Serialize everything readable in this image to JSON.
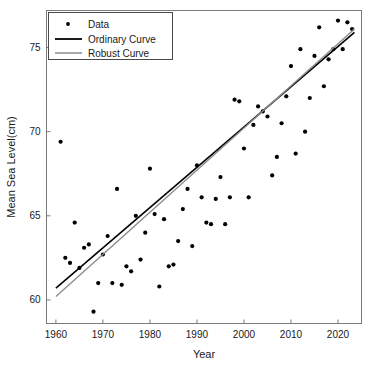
{
  "chart_data": {
    "type": "scatter",
    "title": "",
    "xlabel": "Year",
    "ylabel": "Mean Sea Level(cm)",
    "xlim": [
      1958,
      2025
    ],
    "ylim": [
      58.6,
      77.2
    ],
    "xticks": [
      1960,
      1970,
      1980,
      1990,
      2000,
      2010,
      2020
    ],
    "yticks": [
      60,
      65,
      70,
      75
    ],
    "grid": false,
    "legend_position": "upper-left",
    "legend": [
      {
        "label": "Data",
        "marker": "dot",
        "color": "#000000"
      },
      {
        "label": "Ordinary Curve",
        "marker": "line",
        "color": "#000000"
      },
      {
        "label": "Robust Curve",
        "marker": "line",
        "color": "#8c8c8c"
      }
    ],
    "series": [
      {
        "name": "Data",
        "type": "scatter",
        "color": "#000000",
        "points": [
          [
            1961,
            69.4
          ],
          [
            1962,
            62.5
          ],
          [
            1963,
            62.2
          ],
          [
            1964,
            64.6
          ],
          [
            1965,
            61.9
          ],
          [
            1966,
            63.1
          ],
          [
            1967,
            63.3
          ],
          [
            1968,
            59.3
          ],
          [
            1969,
            61.0
          ],
          [
            1970,
            62.7
          ],
          [
            1971,
            63.8
          ],
          [
            1972,
            61.0
          ],
          [
            1973,
            66.6
          ],
          [
            1974,
            60.9
          ],
          [
            1975,
            62.0
          ],
          [
            1976,
            61.7
          ],
          [
            1977,
            65.0
          ],
          [
            1978,
            62.4
          ],
          [
            1979,
            64.0
          ],
          [
            1980,
            67.8
          ],
          [
            1981,
            65.1
          ],
          [
            1982,
            60.8
          ],
          [
            1983,
            64.8
          ],
          [
            1984,
            62.0
          ],
          [
            1985,
            62.1
          ],
          [
            1986,
            63.5
          ],
          [
            1987,
            65.4
          ],
          [
            1988,
            66.6
          ],
          [
            1989,
            63.2
          ],
          [
            1990,
            68.0
          ],
          [
            1991,
            66.1
          ],
          [
            1992,
            64.6
          ],
          [
            1993,
            64.5
          ],
          [
            1994,
            66.0
          ],
          [
            1995,
            67.3
          ],
          [
            1996,
            64.5
          ],
          [
            1997,
            66.1
          ],
          [
            1998,
            71.9
          ],
          [
            1999,
            71.8
          ],
          [
            2000,
            69.0
          ],
          [
            2001,
            66.1
          ],
          [
            2002,
            70.4
          ],
          [
            2003,
            71.5
          ],
          [
            2004,
            71.2
          ],
          [
            2005,
            70.9
          ],
          [
            2006,
            67.4
          ],
          [
            2007,
            68.5
          ],
          [
            2008,
            70.5
          ],
          [
            2009,
            72.1
          ],
          [
            2010,
            73.9
          ],
          [
            2011,
            68.7
          ],
          [
            2012,
            74.9
          ],
          [
            2013,
            70.0
          ],
          [
            2014,
            72.0
          ],
          [
            2015,
            74.5
          ],
          [
            2016,
            76.2
          ],
          [
            2017,
            72.7
          ],
          [
            2018,
            74.3
          ],
          [
            2019,
            74.9
          ],
          [
            2020,
            76.6
          ],
          [
            2021,
            74.9
          ],
          [
            2022,
            76.5
          ],
          [
            2023,
            76.1
          ]
        ]
      },
      {
        "name": "Ordinary Curve",
        "type": "line",
        "color": "#000000",
        "width": 1.6,
        "endpoints": [
          [
            1960,
            60.7
          ],
          [
            2023.5,
            75.9
          ]
        ]
      },
      {
        "name": "Robust Curve",
        "type": "line",
        "color": "#8c8c8c",
        "width": 1.4,
        "endpoints": [
          [
            1960,
            60.2
          ],
          [
            2023.5,
            76.1
          ]
        ]
      }
    ]
  }
}
